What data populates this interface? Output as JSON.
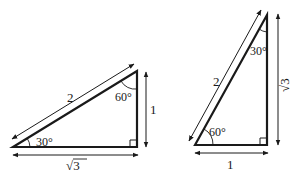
{
  "diagram": {
    "stroke_color": "#1a1a1a",
    "left_triangle": {
      "hypotenuse_label": "2",
      "vertical_side_label": "1",
      "horizontal_side_label": "√3",
      "angle_bottom_left": "30°",
      "angle_top_right": "60°"
    },
    "right_triangle": {
      "hypotenuse_label": "2",
      "vertical_side_label": "√3",
      "horizontal_side_label": "1",
      "angle_bottom_left": "60°",
      "angle_top": "30°"
    }
  }
}
